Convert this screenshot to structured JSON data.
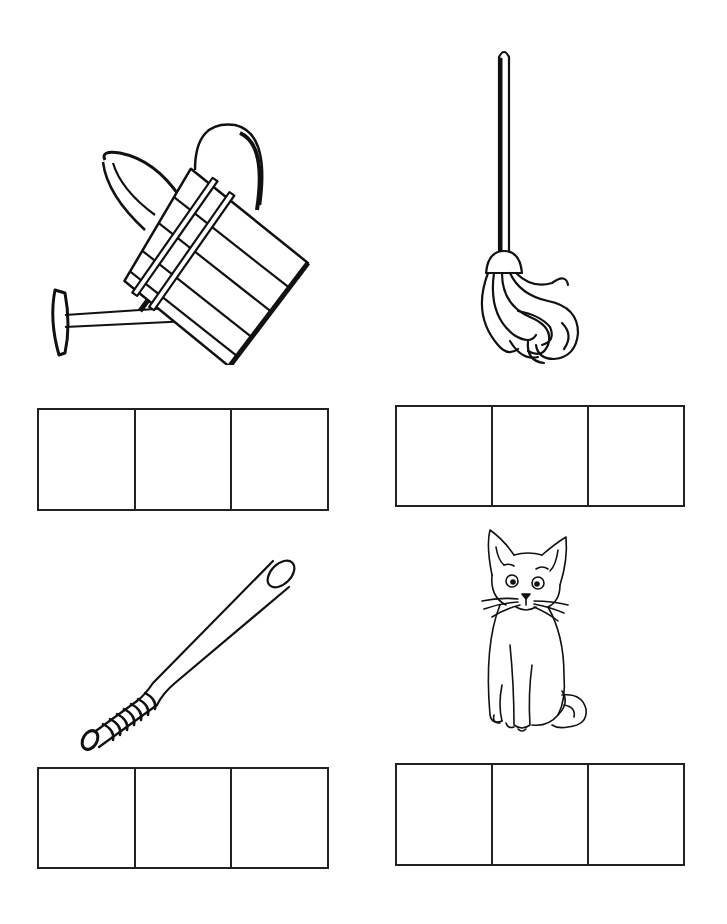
{
  "worksheet": {
    "type": "cvc-word-boxes",
    "boxes_per_word": 3,
    "line_color": "#222222",
    "background": "#ffffff",
    "items": [
      {
        "position": "top-left",
        "picture": "watering-can",
        "word": "can",
        "letters": [
          "",
          "",
          ""
        ]
      },
      {
        "position": "top-right",
        "picture": "mop",
        "word": "mop",
        "letters": [
          "",
          "",
          ""
        ]
      },
      {
        "position": "bottom-left",
        "picture": "baseball-bat",
        "word": "bat",
        "letters": [
          "",
          "",
          ""
        ]
      },
      {
        "position": "bottom-right",
        "picture": "cat",
        "word": "cat",
        "letters": [
          "",
          "",
          ""
        ]
      }
    ]
  }
}
